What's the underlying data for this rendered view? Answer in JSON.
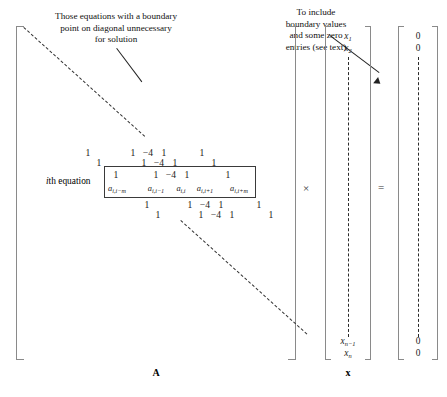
{
  "figure": {
    "annotations": {
      "left_note": "Those equations with a boundary\npoint on diagonal unnecessary\nfor solution",
      "right_note": "To include\nboundary values\nand some zero\nentries (see text)"
    },
    "labels": {
      "ith_equation": "th equation",
      "ith_equation_italic": "i",
      "matrix_A": "A",
      "vector_x": "x",
      "times_symbol": "×",
      "equals_symbol": "="
    },
    "matrix": {
      "name": "A",
      "band_rows": [
        {
          "row": 1,
          "entries": [
            "1",
            "1",
            "−4",
            "1",
            "1"
          ]
        },
        {
          "row": 2,
          "entries": [
            "1",
            "1",
            "−4",
            "1",
            "1"
          ]
        },
        {
          "row": 3,
          "entries": [
            "1",
            "1",
            "−4",
            "1",
            "1"
          ]
        },
        {
          "row": 4,
          "entries": [
            "1",
            "1",
            "−4",
            "1",
            "1"
          ]
        },
        {
          "row": 5,
          "entries": [
            "1",
            "1",
            "−4",
            "1",
            "1"
          ]
        }
      ],
      "ith_row_symbolic": [
        {
          "base": "a",
          "sub": "i,i−m"
        },
        {
          "base": "a",
          "sub": "i,i−1"
        },
        {
          "base": "a",
          "sub": "i,i"
        },
        {
          "base": "a",
          "sub": "i,i+1"
        },
        {
          "base": "a",
          "sub": "i,i+m"
        }
      ],
      "values": {
        "diagonal": "−4",
        "off_diagonal": "1"
      }
    },
    "x_vector": {
      "name": "x",
      "top_entries": [
        {
          "base": "x",
          "sub": "1"
        },
        {
          "base": "x",
          "sub": "2"
        }
      ],
      "bottom_entries": [
        {
          "base": "x",
          "sub": "n−1"
        },
        {
          "base": "x",
          "sub": "n"
        }
      ]
    },
    "rhs_vector": {
      "top_entries": [
        "0",
        "0"
      ],
      "bottom_entries": [
        "0",
        "0"
      ]
    },
    "colors": {
      "bracket": "#8a8a8a",
      "text": "#1a1a1a",
      "dash": "#333333",
      "box_border": "#3a3a3a"
    }
  }
}
